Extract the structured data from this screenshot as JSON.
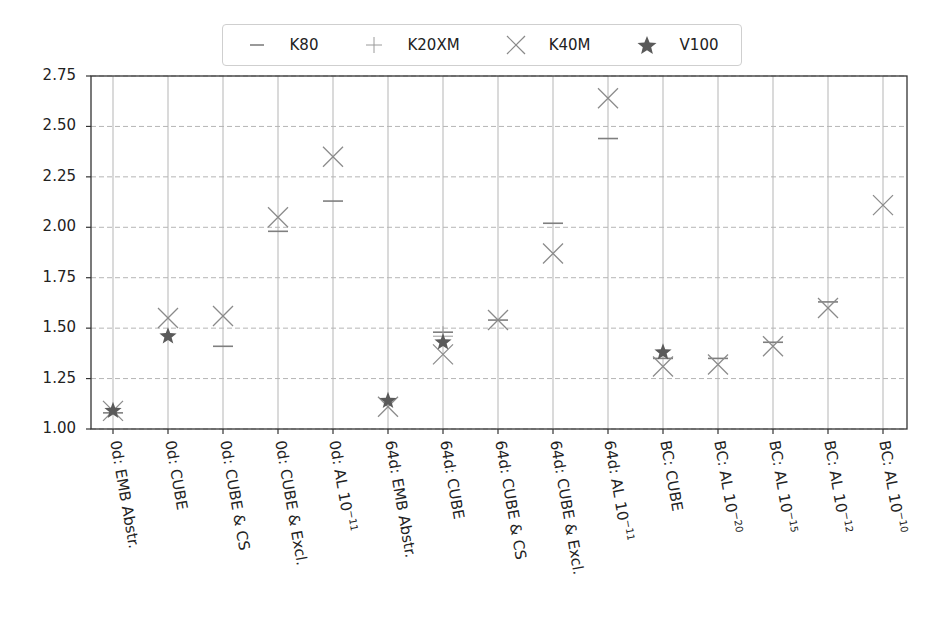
{
  "chart_data": {
    "type": "scatter",
    "title": "",
    "xlabel": "",
    "ylabel": "",
    "ylim": [
      1.0,
      2.75
    ],
    "yticks": [
      "1.00",
      "1.25",
      "1.50",
      "1.75",
      "2.00",
      "2.25",
      "2.50",
      "2.75"
    ],
    "grid": true,
    "legend_position": "top-center",
    "categories": [
      {
        "text": "0d: EMB Abstr.",
        "sup": ""
      },
      {
        "text": "0d: CUBE",
        "sup": ""
      },
      {
        "text": "0d: CUBE & CS",
        "sup": ""
      },
      {
        "text": "0d: CUBE & Excl.",
        "sup": ""
      },
      {
        "text": "0d: AL 10",
        "sup": "−11"
      },
      {
        "text": "64d: EMB Abstr.",
        "sup": ""
      },
      {
        "text": "64d: CUBE",
        "sup": ""
      },
      {
        "text": "64d: CUBE & CS",
        "sup": ""
      },
      {
        "text": "64d: CUBE & Excl.",
        "sup": ""
      },
      {
        "text": "64d: AL 10",
        "sup": "−11"
      },
      {
        "text": "BC: CUBE",
        "sup": ""
      },
      {
        "text": "BC: AL 10",
        "sup": "−20"
      },
      {
        "text": "BC: AL 10",
        "sup": "−15"
      },
      {
        "text": "BC: AL 10",
        "sup": "−12"
      },
      {
        "text": "BC: AL 10",
        "sup": "−10"
      }
    ],
    "series": [
      {
        "name": "K80",
        "marker": "hline",
        "values": [
          1.08,
          null,
          1.41,
          1.98,
          2.13,
          null,
          1.48,
          1.54,
          2.02,
          2.44,
          1.35,
          1.35,
          1.43,
          1.63,
          null
        ]
      },
      {
        "name": "K20XM",
        "marker": "plus",
        "values": [
          null,
          null,
          null,
          null,
          null,
          null,
          1.46,
          null,
          null,
          null,
          null,
          null,
          null,
          null,
          null
        ]
      },
      {
        "name": "K40M",
        "marker": "x",
        "values": [
          1.09,
          1.55,
          1.56,
          2.05,
          2.35,
          1.11,
          1.37,
          1.54,
          1.87,
          2.64,
          1.31,
          1.32,
          1.41,
          1.6,
          2.11
        ]
      },
      {
        "name": "V100",
        "marker": "star",
        "values": [
          1.09,
          1.46,
          null,
          null,
          null,
          1.14,
          1.43,
          null,
          null,
          null,
          1.38,
          null,
          null,
          null,
          null
        ]
      }
    ]
  },
  "colors": {
    "marker": "#7f7f7f",
    "star": "#5a5a5a",
    "grid": "#b5b5b5",
    "axis": "#333333"
  },
  "legend": {
    "items": [
      {
        "label": "K80",
        "icon": "hline-icon"
      },
      {
        "label": "K20XM",
        "icon": "plus-icon"
      },
      {
        "label": "K40M",
        "icon": "x-icon"
      },
      {
        "label": "V100",
        "icon": "star-icon"
      }
    ]
  }
}
